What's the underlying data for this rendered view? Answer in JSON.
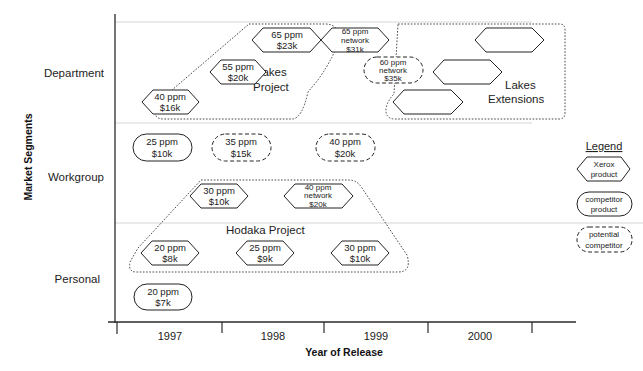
{
  "axes": {
    "x_title": "Year of Release",
    "y_title": "Market Segments",
    "years": [
      "1997",
      "1998",
      "1999",
      "2000"
    ],
    "segments": [
      "Department",
      "Workgroup",
      "Personal"
    ]
  },
  "groups": {
    "lakes_project": {
      "label_line1": "Lakes",
      "label_line2": "Project"
    },
    "lakes_extensions": {
      "label_line1": "Lakes",
      "label_line2": "Extensions"
    },
    "hodaka_project": {
      "label": "Hodaka Project"
    }
  },
  "products": {
    "dept_40ppm": {
      "type": "xerox",
      "line1": "40 ppm",
      "line2": "$16k"
    },
    "dept_55ppm": {
      "type": "xerox",
      "line1": "55 ppm",
      "line2": "$20k"
    },
    "dept_65ppm": {
      "type": "xerox",
      "line1": "65 ppm",
      "line2": "$23k"
    },
    "dept_65ppm_net": {
      "type": "xerox",
      "line1": "65 ppm",
      "line2": "network",
      "line3": "$31k"
    },
    "dept_60ppm_net": {
      "type": "potential",
      "line1": "60 ppm",
      "line2": "network",
      "line3": "$35k"
    },
    "wg_25ppm": {
      "type": "competitor",
      "line1": "25 ppm",
      "line2": "$10k"
    },
    "wg_35ppm": {
      "type": "potential",
      "line1": "35 ppm",
      "line2": "$15k"
    },
    "wg_40ppm": {
      "type": "potential",
      "line1": "40 ppm",
      "line2": "$20k"
    },
    "wg_30ppm": {
      "type": "xerox",
      "line1": "30 ppm",
      "line2": "$10k"
    },
    "wg_40ppm_net": {
      "type": "xerox",
      "line1": "40 ppm",
      "line2": "network",
      "line3": "$20k"
    },
    "pers_20ppm": {
      "type": "xerox",
      "line1": "20 ppm",
      "line2": "$8k"
    },
    "pers_25ppm": {
      "type": "xerox",
      "line1": "25 ppm",
      "line2": "$9k"
    },
    "pers_30ppm": {
      "type": "xerox",
      "line1": "30 ppm",
      "line2": "$10k"
    },
    "pers_20ppm_comp": {
      "type": "competitor",
      "line1": "20 ppm",
      "line2": "$7k"
    }
  },
  "legend": {
    "title": "Legend",
    "xerox": {
      "line1": "Xerox",
      "line2": "product"
    },
    "competitor": {
      "line1": "competitor",
      "line2": "product"
    },
    "potential": {
      "line1": "potential",
      "line2": "competitor"
    }
  }
}
